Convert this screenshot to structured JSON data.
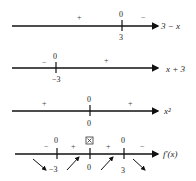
{
  "lines": [
    {
      "expression": "3 − x",
      "zeros": [
        {
          "label": "0",
          "x_value": "3"
        }
      ],
      "signs": [
        "+",
        "−"
      ]
    },
    {
      "expression": "x + 3",
      "zeros": [
        {
          "label": "0",
          "x_value": "−3"
        }
      ],
      "signs": [
        "−",
        "+"
      ]
    },
    {
      "expression": "x²",
      "zeros": [
        {
          "label": "0",
          "x_value": "0"
        }
      ],
      "signs": [
        "+",
        "+"
      ]
    },
    {
      "expression": "f′(x)",
      "zeros": [
        {
          "label": "0",
          "x_value": "−3"
        },
        {
          "label": "⊠",
          "x_value": "0"
        },
        {
          "label": "0",
          "x_value": "3"
        }
      ],
      "signs": [
        "−",
        "+",
        "+",
        "−"
      ],
      "arrows": [
        "down",
        "up",
        "up",
        "down"
      ]
    }
  ]
}
